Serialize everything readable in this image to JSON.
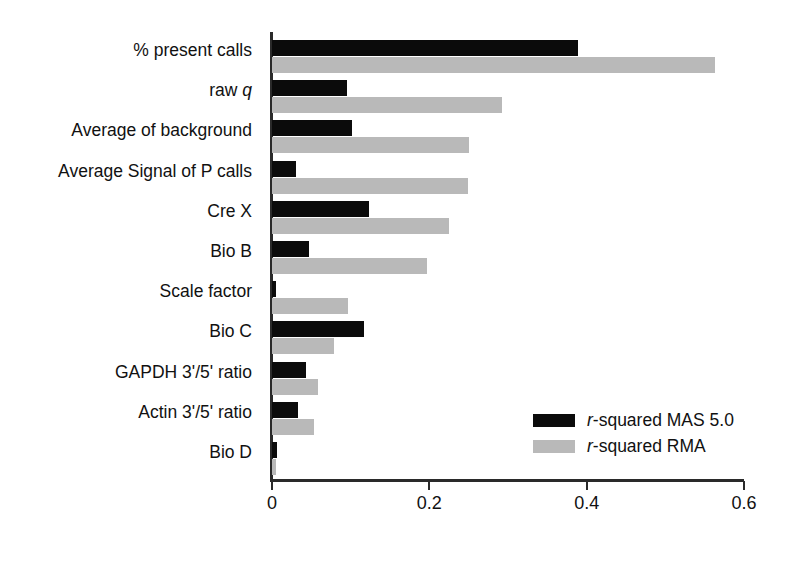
{
  "chart_data": {
    "type": "bar",
    "orientation": "horizontal",
    "title": "",
    "xlabel": "",
    "ylabel": "",
    "xlim": [
      0,
      0.6
    ],
    "xticks": [
      "0",
      "0.2",
      "0.4",
      "0.6"
    ],
    "xtick_values": [
      0,
      0.2,
      0.4,
      0.6
    ],
    "grid": false,
    "legend_position": "lower-right",
    "categories": [
      "% present calls",
      "raw q",
      "Average of background",
      "Average Signal of P calls",
      "Cre X",
      "Bio B",
      "Scale factor",
      "Bio C",
      "GAPDH 3'/5' ratio",
      "Actin 3'/5' ratio",
      "Bio D"
    ],
    "categories_html": [
      "% present calls",
      "raw <span class=\"ital\">q</span>",
      "Average of background",
      "Average Signal of P calls",
      "Cre X",
      "Bio B",
      "Scale factor",
      "Bio C",
      "GAPDH 3'/5' ratio",
      "Actin 3'/5' ratio",
      "Bio D"
    ],
    "series": [
      {
        "name": "r-squared MAS 5.0",
        "name_html": "<span class=\"ital\">r</span>-squared MAS 5.0",
        "color": "#0b0b0b",
        "values": [
          0.389,
          0.095,
          0.102,
          0.03,
          0.123,
          0.047,
          0.005,
          0.117,
          0.043,
          0.033,
          0.006
        ]
      },
      {
        "name": "r-squared RMA",
        "name_html": "<span class=\"ital\">r</span>-squared RMA",
        "color": "#b9b9b9",
        "values": [
          0.563,
          0.292,
          0.25,
          0.249,
          0.225,
          0.197,
          0.097,
          0.079,
          0.059,
          0.054,
          0.005
        ]
      }
    ]
  },
  "colors": {
    "series_mas": "#0b0b0b",
    "series_rma": "#b9b9b9",
    "axis": "#2a2a2a",
    "background": "#ffffff",
    "text": "#111111"
  }
}
